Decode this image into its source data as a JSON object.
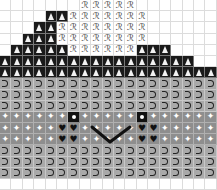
{
  "pattern": {
    "columns": 19,
    "legend": {
      "E": "empty",
      "T": "black-triangle",
      "R": "ribbon",
      "H": "horseshoe",
      "S": "sparkle",
      "Y": "eye",
      "V": "heart"
    },
    "ribbon_glyph": "ℛ",
    "rows": [
      "EEEEEEERRRRREEEEEEE",
      "EEEETTRRRRRRREEEEEE",
      "EEETTRRRRRRRREEEEEE",
      "EETTTRRRRRRRREEEEEE",
      "ETTTTTRRRRRRTTTEEEE",
      "TTTTTTTTTTTTTTTTTEE",
      "TTTTTTTTTTTTTTTTTTT",
      "HHHHHHHHHHHHHHHHHHH",
      "HHHHHHHHHHHHHHHHHHH",
      "HHHHHHHHHHHHHHHHHHH",
      "SSSSSSYSSSSSYSSSSSS",
      "SSSSSVVSSSSSVVSSSSS",
      "SSSSSVVSSSSSVVSSSSS",
      "HHHHHHHHHHHHHHHHHHH",
      "HHHHHHHHHHHHHHHHHHH",
      "HHHHHHHHHHHHHHHHHHH",
      "EEEEEEEEEEEEEEEEEEE"
    ],
    "colors": {
      "triangle_bg": "#1a1a1a",
      "horseshoe_bg": "#a9a9a9",
      "sparkle_bg": "#8e8e8e",
      "smile_line": "#111111"
    }
  }
}
